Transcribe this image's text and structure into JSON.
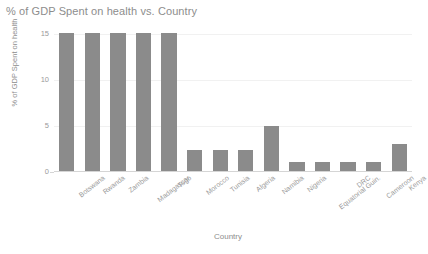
{
  "chart_data": {
    "type": "bar",
    "title": "% of GDP Spent on health vs. Country",
    "xlabel": "Country",
    "ylabel": "% of GDP Spent on health",
    "categories": [
      "Botswana",
      "Rwanda",
      "Zambia",
      "Madagascar",
      "Togo",
      "Morocco",
      "Tunisia",
      "Algeria",
      "Namibia",
      "Nigeria",
      "Equatorial Guin.",
      "DRC",
      "Cameroon",
      "Kenya"
    ],
    "values": [
      15,
      15,
      15,
      15,
      15,
      2.3,
      2.3,
      2.3,
      4.9,
      1.0,
      1.0,
      1.0,
      1.0,
      2.9
    ],
    "ylim": [
      0,
      15
    ],
    "yticks": [
      0,
      5,
      10,
      15
    ],
    "ytick_labels": [
      "0",
      "5",
      "10",
      "15"
    ],
    "grid": true,
    "legend": false,
    "bar_color": "#8b8b8b",
    "text_color": "#8d8d8d",
    "grid_color": "#f1f1f1",
    "axis_color": "#d5d5d5",
    "background": "#ffffff"
  }
}
